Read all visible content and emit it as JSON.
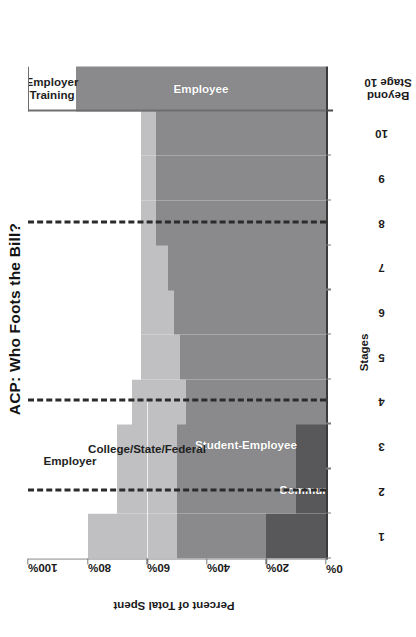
{
  "chart_data": {
    "type": "area",
    "title": "ACP: Who Foots the Bill?",
    "xlabel": "Stages",
    "ylabel": "Percent of Total Spent",
    "ylim": [
      0,
      100
    ],
    "ytick_labels": [
      "0%",
      "20%",
      "40%",
      "60%",
      "80%",
      "100%"
    ],
    "ytick_values": [
      0,
      20,
      40,
      60,
      80,
      100
    ],
    "grid": false,
    "legend_position": "inline-labels",
    "categories": [
      "1",
      "2",
      "3",
      "4",
      "5",
      "6",
      "7",
      "8",
      "9",
      "10",
      "Beyond Stage 10"
    ],
    "xtick_labels": [
      "1",
      "2",
      "3",
      "4",
      "5",
      "6",
      "7",
      "8",
      "9",
      "10"
    ],
    "beyond_label": "Beyond Stage 10",
    "series": [
      {
        "name": "Community",
        "color": "#58585a",
        "label_color": "#ffffff",
        "values": [
          20,
          10,
          10,
          0,
          0,
          0,
          0,
          0,
          0,
          0,
          0
        ]
      },
      {
        "name": "Student-Employee",
        "color": "#8a8a8c",
        "label_color": "#ffffff",
        "values": [
          30,
          40,
          40,
          47,
          49,
          51,
          53,
          57,
          57,
          57,
          84
        ]
      },
      {
        "name": "College/State/Federal",
        "color": "#c0c0c2",
        "label_color": "#1f1f1f",
        "values": [
          30,
          20,
          20,
          18,
          13,
          11,
          9,
          5,
          5,
          5,
          0
        ]
      },
      {
        "name": "Employer",
        "color": "#ffffff",
        "label_color": "#1f1f1f",
        "values": [
          20,
          30,
          30,
          35,
          38,
          38,
          38,
          38,
          38,
          38,
          0
        ]
      },
      {
        "name": "Employer Training",
        "color": "#ffffff",
        "label_color": "#1f1f1f",
        "values": [
          0,
          0,
          0,
          0,
          0,
          0,
          0,
          0,
          0,
          0,
          16
        ]
      },
      {
        "name": "Employee",
        "color": "#8a8a8c",
        "label_color": "#ffffff",
        "values": [
          0,
          0,
          0,
          0,
          0,
          0,
          0,
          0,
          0,
          0,
          84
        ]
      }
    ],
    "annotations": [
      {
        "name": "phase-divider-1",
        "type": "dashed-vertical",
        "at_stage": 1.5
      },
      {
        "name": "phase-divider-2",
        "type": "dashed-vertical",
        "at_stage": 3.5
      },
      {
        "name": "phase-divider-3",
        "type": "dashed-vertical",
        "at_stage": 7.5
      }
    ],
    "inline_labels": [
      {
        "name": "Community",
        "region": "bottom-left"
      },
      {
        "name": "Student-Employee",
        "region": "lower-middle"
      },
      {
        "name": "College/State/Federal",
        "region": "middle"
      },
      {
        "name": "Employer",
        "region": "upper-left"
      },
      {
        "name": "Employer Training",
        "region": "beyond-top"
      },
      {
        "name": "Employee",
        "region": "beyond-body"
      }
    ]
  },
  "colors": {
    "community": "#58585a",
    "student_employee": "#8a8a8c",
    "college_state_federal": "#c0c0c2",
    "employer": "#ffffff",
    "employee": "#8a8a8c",
    "employer_training": "#ffffff",
    "axis": "#6e6e6e",
    "divider": "#2b2b2b",
    "text": "#1a1a1a"
  }
}
